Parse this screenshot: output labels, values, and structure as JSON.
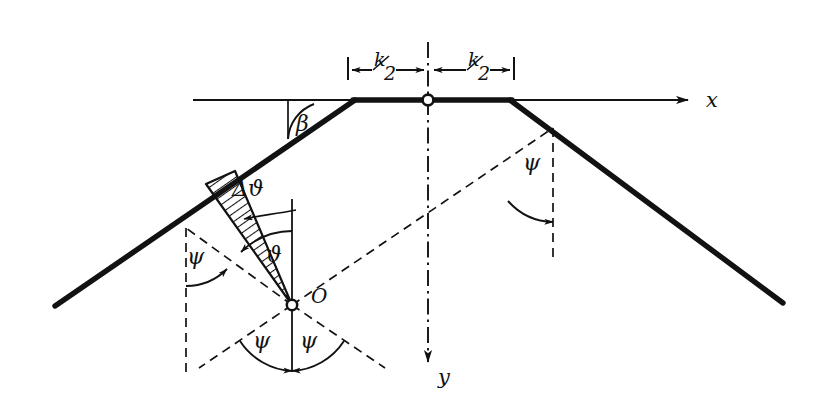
{
  "figure": {
    "background_color": "#ffffff",
    "ink_color": "#121212"
  },
  "axes": {
    "x_label": "x",
    "y_label": "y",
    "origin_marker": "open-circle-node"
  },
  "dimensions": {
    "left": {
      "label": "k/2",
      "numerator": "k",
      "denominator": "2"
    },
    "right": {
      "label": "k/2",
      "numerator": "k",
      "denominator": "2"
    }
  },
  "angles": {
    "beta": "β",
    "psi_left": "ψ",
    "psi_right": "ψ",
    "psi_bottom_left": "ψ",
    "psi_bottom_right": "ψ",
    "theta": "ϑ",
    "delta_theta": "Δϑ"
  },
  "points": {
    "origin_label": "O"
  },
  "regions": {
    "wedge_fill": "hatched"
  }
}
